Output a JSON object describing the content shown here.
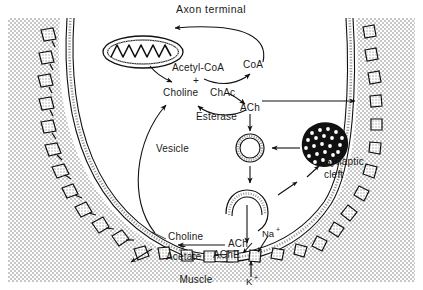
{
  "figure": {
    "title": "Axon terminal",
    "ink_color": "#111111",
    "background_color": "#ffffff",
    "stipple_color": "#c9c9c9"
  },
  "labels": {
    "axon_terminal": "Axon terminal",
    "acetyl_coa": "Acetyl-CoA",
    "plus_top": "+",
    "choline_top": "Choline",
    "chac": "ChAc",
    "coa": "CoA",
    "ach_top": "ACh",
    "esterase": "Esterase",
    "vesicle": "Vesicle",
    "synaptic_cleft_line1": "Synaptic",
    "synaptic_cleft_line2": "cleft",
    "choline_bottom": "Choline",
    "plus_bottom": "+",
    "acetate": "Acetate",
    "ache": "AChE",
    "ach_bottom": "ACh",
    "sodium": "Na",
    "sodium_charge": "+",
    "potassium": "K",
    "potassium_charge": "+",
    "muscle": "Muscle"
  },
  "organelles": {
    "mitochondrion": "mitochondrion",
    "vesicle_free": "synaptic-vesicle",
    "vesicle_fusing": "fusing-vesicle",
    "vesicle_cluster": "vesicle-cluster",
    "muscle_cells_left_count": 11,
    "muscle_cells_right_count": 9
  },
  "flow": {
    "steps": [
      "Acetyl-CoA + Choline react via ChAc",
      "CoA returns to mitochondrion",
      "ACh is produced",
      "ACh is packaged into vesicle",
      "Vesicle fuses with terminal membrane",
      "ACh released into synaptic cleft",
      "AChE splits ACh into Choline + Acetate",
      "Choline is recycled into the terminal",
      "Na+ enters and K+ exits muscle"
    ]
  }
}
